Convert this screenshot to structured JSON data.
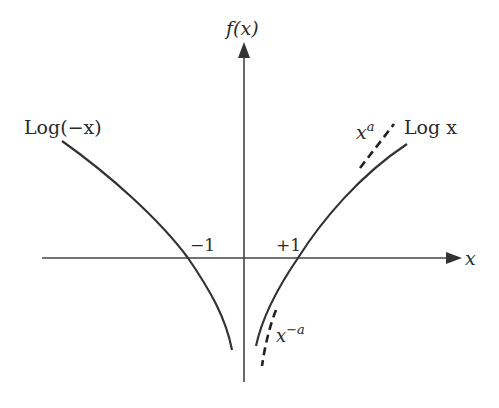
{
  "diagram": {
    "type": "function-plot",
    "y_axis_label": "f(x)",
    "x_axis_label": "x",
    "ticks": {
      "neg_one": "−1",
      "pos_one": "+1"
    },
    "curves": {
      "left": {
        "label": "Log(−x)",
        "style": "solid"
      },
      "right": {
        "label": "Log x",
        "style": "solid"
      },
      "upper_asymptote": {
        "base": "x",
        "exponent": "a",
        "style": "dashed"
      },
      "lower_asymptote": {
        "base": "x",
        "exponent": "−a",
        "style": "dashed"
      }
    },
    "colors": {
      "stroke": "#333333",
      "text": "#2a2a2a",
      "background": "#ffffff"
    }
  }
}
